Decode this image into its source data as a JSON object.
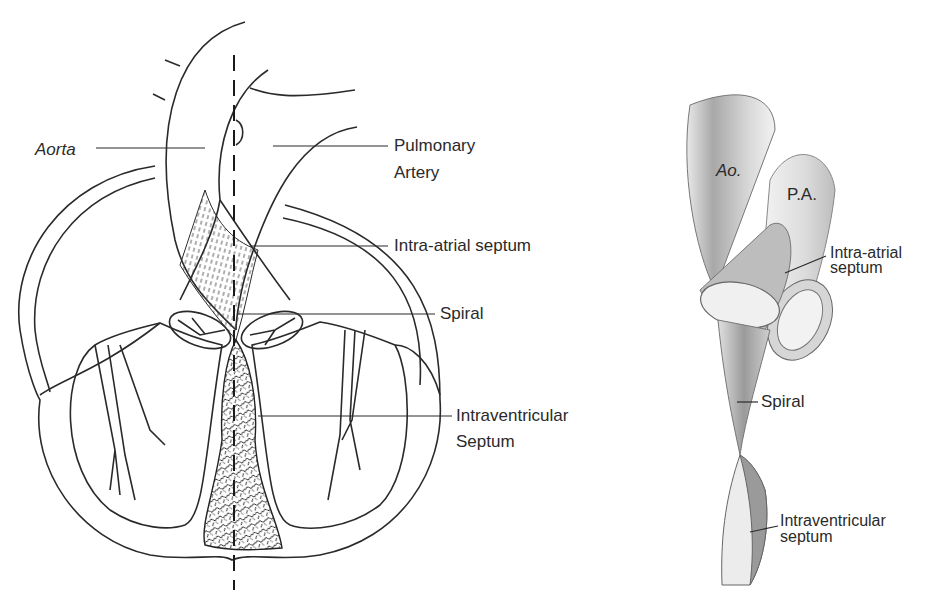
{
  "left_figure": {
    "labels": {
      "aorta": "Aorta",
      "pulmonary_1": "Pulmonary",
      "pulmonary_2": "Artery",
      "intra_atrial": "Intra-atrial septum",
      "spiral": "Spiral",
      "intraventricular_1": "Intraventricular",
      "intraventricular_2": "Septum"
    }
  },
  "right_figure": {
    "labels": {
      "ao": "Ao.",
      "pa": "P.A.",
      "intra_atrial_1": "Intra-atrial",
      "intra_atrial_2": "septum",
      "spiral": "Spiral",
      "intraventricular_1": "Intraventricular",
      "intraventricular_2": "septum"
    }
  },
  "colors": {
    "ink": "#2a2a2a",
    "shade": "#8a8a8a",
    "background": "#ffffff"
  }
}
